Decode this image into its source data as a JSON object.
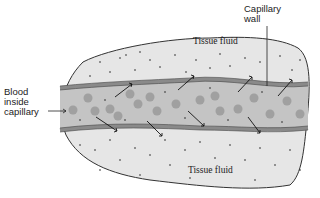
{
  "diagram": {
    "labels": {
      "tissue_fluid_top": "Tissue fluid",
      "tissue_fluid_bottom": "Tissue fluid",
      "capillary_wall_line1": "Capillary",
      "capillary_wall_line2": "wall",
      "blood_line1": "Blood",
      "blood_line2": "inside",
      "blood_line3": "capillary"
    },
    "colors": {
      "tissue": "#e6e6e6",
      "capillary_lumen": "#c4c4c4",
      "capillary_wall": "#8a8a8a",
      "blood_cell": "#9a9a9a",
      "outline": "#333333",
      "background": "#ffffff"
    }
  }
}
